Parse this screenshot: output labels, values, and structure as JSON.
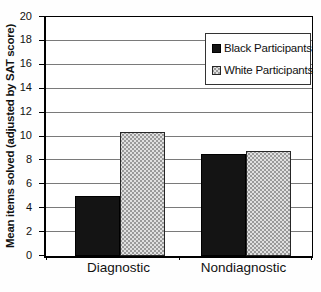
{
  "chart_data": {
    "type": "bar",
    "title": "",
    "ylabel": "Mean items solved (adjusted by SAT score)",
    "xlabel": "",
    "categories": [
      "Diagnostic",
      "Nondiagnostic"
    ],
    "series": [
      {
        "name": "Black Participants",
        "pattern": "solid",
        "color": "#141414",
        "values": [
          5.0,
          8.5
        ]
      },
      {
        "name": "White Participants",
        "pattern": "dotted",
        "color": "#dddddd",
        "values": [
          10.4,
          8.8
        ]
      }
    ],
    "ylim": [
      0,
      20
    ],
    "yticks": [
      0,
      2,
      4,
      6,
      8,
      10,
      12,
      14,
      16,
      18,
      20
    ],
    "grid": true,
    "gridline_color": "#7a7a7a",
    "axis_color": "#000000",
    "legend_position": "top-right"
  }
}
